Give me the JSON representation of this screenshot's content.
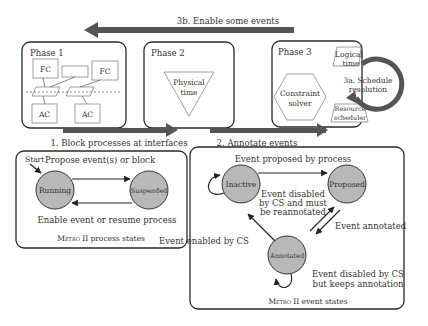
{
  "top_arrow": {
    "label": "3b. Enable some events"
  },
  "phase1": {
    "title": "Phase 1",
    "fc_left": "FC",
    "fc_right": "FC",
    "ac_left": "AC",
    "ac_right": "AC"
  },
  "phase2": {
    "title": "Phase 2",
    "physical_time": [
      "Physical",
      "time"
    ]
  },
  "phase3": {
    "title": "Phase 3",
    "logical_time": [
      "Logical",
      "time"
    ],
    "constraint_solver": [
      "Constraint",
      "solver"
    ],
    "resource_scheduler": [
      "Resource",
      "scheduler"
    ],
    "loop_label": [
      "3a. Schedule",
      "resolution"
    ]
  },
  "arrow1": {
    "label": "1. Block processes at interfaces"
  },
  "arrow2": {
    "label": "2. Annotate events"
  },
  "process_states": {
    "caption_prefix": "Metro",
    "caption_suffix": " II process states",
    "start_label": "Start",
    "states": [
      "Running",
      "Suspended"
    ],
    "edges": {
      "top": "Propose event(s) or block",
      "bottom": "Enable event or resume process"
    }
  },
  "event_states": {
    "caption_prefix": "Metro",
    "caption_suffix": " II event states",
    "states": [
      "Inactive",
      "Proposed",
      "Annotated"
    ],
    "edges": {
      "inactive_to_proposed": "Event proposed by process",
      "proposed_to_inactive": [
        "Event disabled",
        "by CS and must",
        "be reannotated"
      ],
      "proposed_to_annotated": "Event annotated",
      "annotated_to_inactive": "Event enabled by CS",
      "annotated_self": [
        "Event disabled by CS",
        "but keeps annotation"
      ]
    }
  }
}
